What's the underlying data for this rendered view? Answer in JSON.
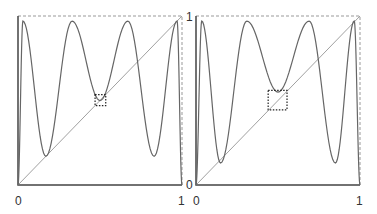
{
  "panels": [
    {
      "id": "left",
      "frame": {
        "x": 18,
        "y": 16,
        "w": 164,
        "h": 169
      },
      "labels": {
        "x0": "0",
        "x1": "1",
        "y0": "0",
        "y1": "1"
      },
      "box": {
        "x0": 0.47,
        "x1": 0.535,
        "y0": 0.47,
        "y1": 0.535
      },
      "minima": [
        0.17,
        0.5,
        0.17
      ],
      "min_positions": [
        0.17,
        0.5,
        0.83
      ],
      "max_positions": [
        0.03,
        0.33,
        0.67,
        0.97
      ]
    },
    {
      "id": "right",
      "frame": {
        "x": 196,
        "y": 16,
        "w": 164,
        "h": 169
      },
      "labels": {
        "x0": "0",
        "x1": "1",
        "y0": "0",
        "y1": ""
      },
      "box": {
        "x0": 0.44,
        "x1": 0.555,
        "y0": 0.445,
        "y1": 0.56
      },
      "minima": [
        0.13,
        0.55,
        0.13
      ],
      "min_positions": [
        0.15,
        0.5,
        0.85
      ],
      "max_positions": [
        0.035,
        0.31,
        0.69,
        0.965
      ]
    }
  ],
  "colors": {
    "curve": "#666666",
    "diagonal": "#888888",
    "axis": "#444444",
    "dashed": "#999999",
    "box": "#222222"
  }
}
